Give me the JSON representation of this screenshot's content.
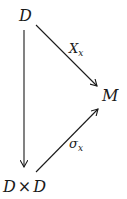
{
  "diagram": {
    "type": "commutative-diagram",
    "nodes": {
      "top": {
        "label": "D"
      },
      "right": {
        "label": "M"
      },
      "bottom_left": {
        "label_left": "D",
        "operator": "×",
        "label_right": "D"
      }
    },
    "arrows": {
      "top_to_right": {
        "label_main": "X",
        "label_sub": "x",
        "from": "D",
        "to": "M"
      },
      "bottom_to_right": {
        "label_main": "σ",
        "label_sub": "x",
        "from": "D × D",
        "to": "M"
      },
      "top_to_bottom": {
        "label": "",
        "from": "D",
        "to": "D × D"
      }
    },
    "colors": {
      "stroke": "#1a1a1a",
      "background": "#ffffff"
    }
  }
}
